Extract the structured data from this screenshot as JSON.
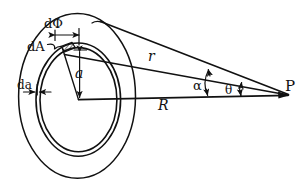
{
  "figure": {
    "type": "geometry-diagram",
    "style": "hand-drawn line art",
    "background_color": "#ffffff",
    "ink_color": "#111111",
    "labels": {
      "d_phi": "dΦ",
      "dA": "dA",
      "da": "da",
      "a": "a",
      "r": "r",
      "R": "R",
      "alpha": "α",
      "theta": "θ",
      "P": "P"
    },
    "label_meanings": {
      "d_phi": "differential azimuthal angle subtended by the area element",
      "dA": "differential area element on the ring",
      "da": "differential radial thickness of the ring",
      "a": "radius of the ring element measured from the disk center",
      "r": "distance from the area element dA to the field point P",
      "R": "distance from the disk center to the field point P along the axis line",
      "alpha": "angle at P between the line r and the baseline R",
      "theta": "angle at P between the outer-edge line and the baseline R",
      "P": "field point"
    },
    "elements": [
      {
        "name": "outer-disk-ellipse",
        "kind": "ellipse",
        "role": "outer boundary of the disk"
      },
      {
        "name": "ring-outer-ellipse",
        "kind": "ellipse",
        "role": "outer edge of the differential ring"
      },
      {
        "name": "ring-inner-ellipse",
        "kind": "ellipse",
        "role": "inner edge of the differential ring"
      },
      {
        "name": "radius-line-a",
        "kind": "line",
        "role": "radius from center to area element"
      },
      {
        "name": "baseline-R",
        "kind": "line",
        "role": "horizontal baseline from center to P"
      },
      {
        "name": "distance-line-r",
        "kind": "line",
        "role": "slant line from area element to P"
      },
      {
        "name": "edge-line-theta",
        "kind": "line",
        "role": "line from disk top edge to P"
      },
      {
        "name": "hatched-area-element",
        "kind": "patch",
        "role": "shaded differential area dA"
      },
      {
        "name": "dphi-dimension",
        "kind": "dimension",
        "role": "double arrow marking dΦ width"
      },
      {
        "name": "da-dimension",
        "kind": "dimension",
        "role": "double arrow marking da thickness"
      },
      {
        "name": "a-dimension",
        "kind": "dimension",
        "role": "vertical double arrow marking a"
      },
      {
        "name": "alpha-arc",
        "kind": "dimension",
        "role": "arc-arrow marking angle α at P"
      },
      {
        "name": "theta-arc",
        "kind": "dimension",
        "role": "arc-arrow marking angle θ at P"
      }
    ]
  }
}
